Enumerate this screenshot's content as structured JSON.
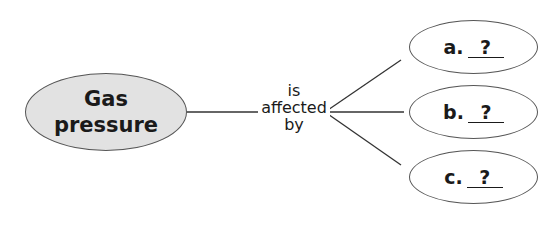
{
  "diagram": {
    "type": "concept-map",
    "main_node": {
      "line1": "Gas",
      "line2": "pressure"
    },
    "link_label": {
      "line1": "is",
      "line2": "affected",
      "line3": "by"
    },
    "branches": [
      {
        "letter": "a.",
        "blank": "?"
      },
      {
        "letter": "b.",
        "blank": "?"
      },
      {
        "letter": "c.",
        "blank": "?"
      }
    ],
    "colors": {
      "main_fill": "#e2e2e2",
      "stroke": "#555555",
      "text": "#1a1a1a"
    }
  }
}
